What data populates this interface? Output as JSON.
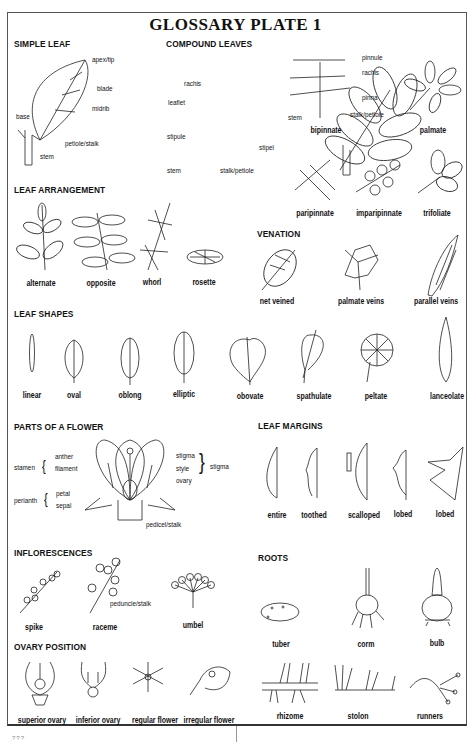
{
  "title": "GLOSSARY PLATE 1",
  "sections": {
    "simple_leaf": {
      "heading": "SIMPLE LEAF",
      "labels": {
        "apex": "apex/tip",
        "blade": "blade",
        "midrib": "midrib",
        "base": "base",
        "petiole": "petiole/stalk",
        "stem": "stem"
      }
    },
    "compound_leaves": {
      "heading": "COMPOUND LEAVES",
      "labels": {
        "rachis": "rachis",
        "leaflet": "leaflet",
        "stipule": "stipule",
        "stipel": "stipel",
        "stem": "stem",
        "stalk": "stalk/petiole"
      },
      "bipinnate_labels": {
        "pinnule": "pinnule",
        "rachis": "rachis",
        "pinna": "pinna",
        "stalk": "stalk/petiole",
        "stem": "stem"
      },
      "captions": [
        "bipinnate",
        "palmate",
        "paripinnate",
        "imparipinnate",
        "trifoliate"
      ]
    },
    "leaf_arrangement": {
      "heading": "LEAF ARRANGEMENT",
      "captions": [
        "alternate",
        "opposite",
        "whorl",
        "rosette"
      ]
    },
    "venation": {
      "heading": "VENATION",
      "captions": [
        "net veined",
        "palmate veins",
        "parallel veins"
      ]
    },
    "leaf_shapes": {
      "heading": "LEAF SHAPES",
      "captions": [
        "linear",
        "oval",
        "oblong",
        "elliptic",
        "obovate",
        "spathulate",
        "peltate",
        "lanceolate"
      ]
    },
    "parts_of_flower": {
      "heading": "PARTS OF A FLOWER",
      "labels": {
        "stamen": "stamen",
        "anther": "anther",
        "filament": "filament",
        "perianth": "perianth",
        "petal": "petal",
        "sepal": "sepal",
        "stigma": "stigma",
        "style": "style",
        "ovary": "ovary",
        "group_stigma": "stigma",
        "pedicel": "pedicel/stalk"
      }
    },
    "leaf_margins": {
      "heading": "LEAF MARGINS",
      "captions": [
        "entire",
        "toothed",
        "scalloped",
        "lobed",
        "lobed"
      ]
    },
    "inflorescences": {
      "heading": "INFLORESCENCES",
      "labels": {
        "peduncle": "peduncle/stalk"
      },
      "captions": [
        "spike",
        "raceme",
        "umbel"
      ]
    },
    "roots": {
      "heading": "ROOTS",
      "captions": [
        "tuber",
        "corm",
        "bulb",
        "rhizome",
        "stolon",
        "runners"
      ]
    },
    "ovary_position": {
      "heading": "OVARY POSITION",
      "captions": [
        "superior ovary",
        "inferior ovary",
        "regular flower",
        "irregular flower"
      ]
    }
  },
  "page_number": "???"
}
